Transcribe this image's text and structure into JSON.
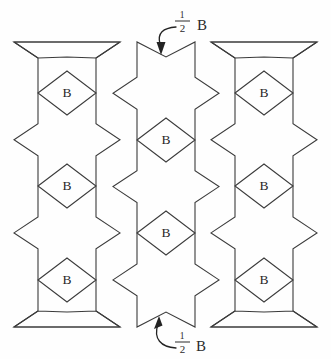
{
  "figure": {
    "background_color": "#fefefe",
    "line_color": "#3b3b3b"
  },
  "labels": {
    "cell_label": "B",
    "half_label_numerator": "1",
    "half_label_denominator": "2",
    "half_label_unit": "B",
    "half_label_full": "1/2 B"
  },
  "annotations": [
    {
      "name": "top-half-b-callout",
      "text_numerator": "1",
      "text_denominator": "2",
      "text_unit": "B",
      "position": "top-center",
      "points_to": "top notch of centre column"
    },
    {
      "name": "bottom-half-b-callout",
      "text_numerator": "1",
      "text_denominator": "2",
      "text_unit": "B",
      "position": "bottom-center",
      "points_to": "bottom notch of centre column"
    }
  ],
  "columns": [
    {
      "name": "left-column",
      "index": 0,
      "center_x": 67,
      "cells": [
        {
          "label": "B",
          "cx": 67,
          "cy": 93
        },
        {
          "label": "B",
          "cx": 67,
          "cy": 186
        },
        {
          "label": "B",
          "cx": 67,
          "cy": 280
        }
      ]
    },
    {
      "name": "center-column",
      "index": 1,
      "center_x": 166,
      "cells": [
        {
          "label": "B",
          "cx": 166,
          "cy": 140
        },
        {
          "label": "B",
          "cx": 166,
          "cy": 233
        }
      ]
    },
    {
      "name": "right-column",
      "index": 2,
      "center_x": 264,
      "cells": [
        {
          "label": "B",
          "cx": 264,
          "cy": 93
        },
        {
          "label": "B",
          "cx": 264,
          "cy": 186
        },
        {
          "label": "B",
          "cx": 264,
          "cy": 280
        }
      ]
    }
  ]
}
